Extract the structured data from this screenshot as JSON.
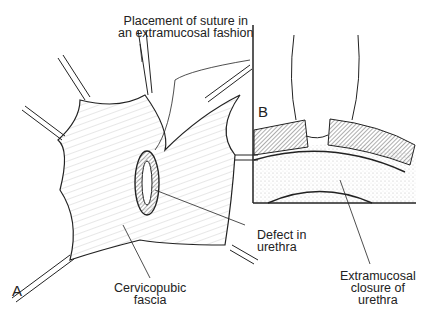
{
  "figure": {
    "panels": [
      {
        "id": "A",
        "label": "A",
        "description": "Surgical view of cervicopubic fascia with urethral defect retracted"
      },
      {
        "id": "B",
        "label": "B",
        "description": "Cross-section showing extramucosal suture closure of urethra"
      }
    ],
    "annotations": {
      "suture_placement": {
        "line1": "Placement of suture in",
        "line2": "an extramucosal fashion"
      },
      "defect": {
        "line1": "Defect in",
        "line2": "urethra"
      },
      "fascia": {
        "line1": "Cervicopubic",
        "line2": "fascia"
      },
      "closure": {
        "line1": "Extramucosal",
        "line2": "closure of",
        "line3": "urethra"
      }
    },
    "colors": {
      "ink": "#222222",
      "background": "#ffffff"
    }
  }
}
